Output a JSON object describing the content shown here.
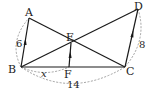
{
  "diagram": {
    "points": {
      "A": {
        "label": "A",
        "x": 29,
        "y": 18
      },
      "B": {
        "label": "B",
        "x": 21,
        "y": 67
      },
      "C": {
        "label": "C",
        "x": 125,
        "y": 67
      },
      "D": {
        "label": "D",
        "x": 138,
        "y": 9
      },
      "E": {
        "label": "E",
        "x": 71,
        "y": 43
      },
      "F": {
        "label": "F",
        "x": 69,
        "y": 67
      }
    },
    "segments": [
      "AB",
      "AC",
      "BD",
      "DC",
      "BC",
      "EF"
    ],
    "parallel_marks": [
      "AB",
      "EF",
      "DC"
    ],
    "measurements": {
      "AB": "6",
      "DC": "8",
      "BF": "x",
      "BC": "14"
    },
    "colors": {
      "line": "#1a1a1a",
      "dashed": "#8a8a8a",
      "text": "#222222"
    }
  }
}
